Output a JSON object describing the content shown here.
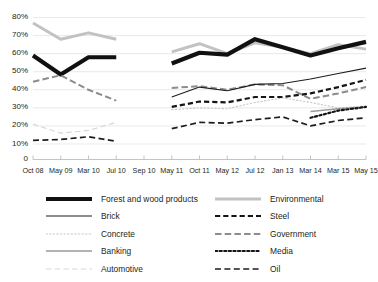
{
  "chart_data": {
    "type": "line",
    "title": "",
    "subtitle": "",
    "xlabel": "",
    "ylabel": "",
    "grid": true,
    "legend_position": "bottom",
    "ylim": [
      0,
      80
    ],
    "ytick_labels": [
      "0",
      "10%",
      "20%",
      "30%",
      "40%",
      "50%",
      "60%",
      "70%",
      "80%"
    ],
    "ytick_values": [
      0,
      10,
      20,
      30,
      40,
      50,
      60,
      70,
      80
    ],
    "categories": [
      "Oct 08",
      "May 09",
      "Mar 10",
      "Jul 10",
      "Sep 10",
      "May 11",
      "Oct 11",
      "May 12",
      "Jul 12",
      "Jan 13",
      "Mar 14",
      "Mar 15",
      "May 15"
    ],
    "series": [
      {
        "name": "Forest and wood products",
        "style": "solid-thick",
        "color": "#111111",
        "width": 4.2,
        "values": [
          59,
          48.5,
          58,
          58,
          null,
          54.5,
          60.5,
          59.5,
          68,
          63.5,
          59,
          63,
          66.5
        ]
      },
      {
        "name": "Brick",
        "style": "solid-thin",
        "color": "#1d1d1d",
        "width": 1.1,
        "values": [
          null,
          null,
          null,
          null,
          null,
          36,
          41.5,
          39.5,
          43,
          43.5,
          46,
          49,
          52
        ]
      },
      {
        "name": "Concrete",
        "style": "dotted",
        "color": "#c8c8c8",
        "width": 1.1,
        "values": [
          null,
          null,
          null,
          null,
          null,
          29,
          30,
          29.5,
          33,
          35.5,
          33,
          30,
          31
        ]
      },
      {
        "name": "Banking",
        "style": "solid-gray",
        "color": "#9a9a9a",
        "width": 1.6,
        "values": [
          null,
          null,
          null,
          null,
          null,
          null,
          null,
          null,
          null,
          null,
          28,
          29.5,
          30.5
        ]
      },
      {
        "name": "Automotive",
        "style": "dashed-light",
        "color": "#d7d7d7",
        "width": 1.2,
        "values": [
          21,
          16,
          17.5,
          22,
          null,
          null,
          null,
          null,
          null,
          null,
          null,
          null,
          null
        ]
      },
      {
        "name": "Environmental",
        "style": "solid-light",
        "color": "#c2c2c2",
        "width": 3.0,
        "values": [
          77,
          68,
          71.5,
          68,
          null,
          61,
          65.5,
          60,
          66,
          63.5,
          60,
          65,
          62.5
        ]
      },
      {
        "name": "Steel",
        "style": "dashed-bold",
        "color": "#151515",
        "width": 2.2,
        "values": [
          null,
          null,
          null,
          null,
          null,
          30.5,
          33.5,
          33,
          36,
          36,
          38,
          41.5,
          45.5
        ]
      },
      {
        "name": "Government",
        "style": "dash-dot-gray",
        "color": "#8c8c8c",
        "width": 2.0,
        "values": [
          44.5,
          48,
          40,
          34,
          null,
          41,
          42,
          40,
          43,
          42.5,
          35,
          38,
          41.5
        ]
      },
      {
        "name": "Media",
        "style": "dotted-bold",
        "color": "#151515",
        "width": 2.2,
        "values": [
          null,
          null,
          null,
          null,
          null,
          null,
          null,
          null,
          null,
          null,
          24.5,
          28.5,
          30.5
        ]
      },
      {
        "name": "Oil",
        "style": "dashed",
        "color": "#1d1d1d",
        "width": 1.7,
        "values": [
          12,
          12.5,
          14,
          11.5,
          null,
          18.5,
          22,
          21.5,
          23.5,
          25,
          20,
          23,
          24.5
        ]
      }
    ]
  },
  "legend": {
    "left_column": [
      {
        "label": "Forest and wood products",
        "swatch": "solid-thick-black-line-icon"
      },
      {
        "label": "Brick",
        "swatch": "solid-thin-dark-line-icon"
      },
      {
        "label": "Concrete",
        "swatch": "dotted-light-line-icon"
      },
      {
        "label": "Banking",
        "swatch": "solid-gray-line-icon"
      },
      {
        "label": "Automotive",
        "swatch": "dashed-very-light-line-icon"
      }
    ],
    "right_column": [
      {
        "label": "Environmental",
        "swatch": "solid-light-gray-line-icon"
      },
      {
        "label": "Steel",
        "swatch": "dashed-bold-black-line-icon"
      },
      {
        "label": "Government",
        "swatch": "dash-dot-gray-line-icon"
      },
      {
        "label": "Media",
        "swatch": "dotted-bold-black-line-icon"
      },
      {
        "label": "Oil",
        "swatch": "dashed-black-line-icon"
      }
    ]
  },
  "colors": {
    "grid": "#e6e6e6",
    "axis": "#bdbdbd",
    "text": "#231f20",
    "black": "#111111",
    "gray": "#9a9a9a",
    "light_gray": "#c2c2c2"
  }
}
